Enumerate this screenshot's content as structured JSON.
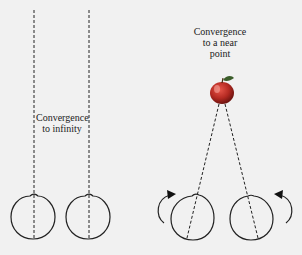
{
  "labels": {
    "infinity_line1": "Convergence",
    "infinity_line2": "to infinity",
    "near_line1": "Convergence",
    "near_line2": "to a near",
    "near_line3": "point"
  },
  "objects": {
    "near_target": "apple",
    "eyes": 4
  },
  "colors": {
    "background": "#f1f1f1",
    "line": "#222222",
    "apple": "#b52a22"
  }
}
